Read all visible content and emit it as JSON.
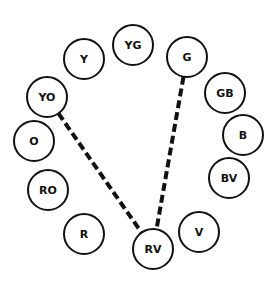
{
  "diagram": {
    "type": "color-wheel",
    "nodes": [
      {
        "id": "Y",
        "label": "Y",
        "cx": 84,
        "cy": 59,
        "r": 20
      },
      {
        "id": "YG",
        "label": "YG",
        "cx": 133,
        "cy": 45,
        "r": 20
      },
      {
        "id": "G",
        "label": "G",
        "cx": 187,
        "cy": 57,
        "r": 20
      },
      {
        "id": "GB",
        "label": "GB",
        "cx": 225,
        "cy": 93,
        "r": 20
      },
      {
        "id": "B",
        "label": "B",
        "cx": 243,
        "cy": 135,
        "r": 20
      },
      {
        "id": "BV",
        "label": "BV",
        "cx": 229,
        "cy": 178,
        "r": 20
      },
      {
        "id": "V",
        "label": "V",
        "cx": 199,
        "cy": 232,
        "r": 20
      },
      {
        "id": "RV",
        "label": "RV",
        "cx": 153,
        "cy": 249,
        "r": 20
      },
      {
        "id": "R",
        "label": "R",
        "cx": 84,
        "cy": 234,
        "r": 20
      },
      {
        "id": "RO",
        "label": "RO",
        "cx": 48,
        "cy": 190,
        "r": 20
      },
      {
        "id": "O",
        "label": "O",
        "cx": 34,
        "cy": 141,
        "r": 20
      },
      {
        "id": "YO",
        "label": "YO",
        "cx": 47,
        "cy": 97,
        "r": 20
      }
    ],
    "edges": [
      {
        "from": "YO",
        "to": "RV",
        "style": "dashed"
      },
      {
        "from": "G",
        "to": "RV",
        "style": "dashed"
      }
    ],
    "colors": {
      "stroke": "#111111",
      "background": "#ffffff"
    }
  }
}
